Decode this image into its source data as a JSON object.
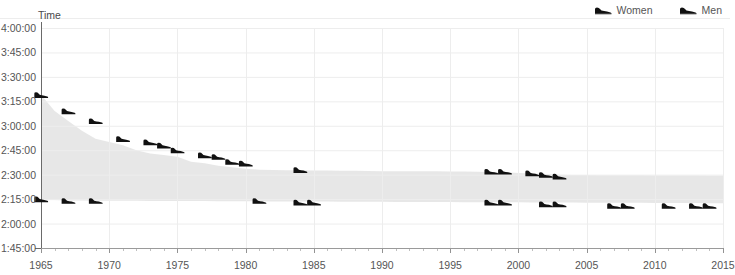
{
  "header": {
    "clipped_title": "",
    "y_axis_title": "Time"
  },
  "legend": {
    "position": "top-right",
    "items": [
      {
        "label": "Women",
        "icon": "shoe-icon",
        "color": "#111111"
      },
      {
        "label": "Men",
        "icon": "shoe-icon",
        "color": "#111111"
      }
    ]
  },
  "colors": {
    "marker": "#111111",
    "area_fill": "#e3e3e3",
    "grid": "#ededed",
    "axis": "#808080",
    "text": "#555555"
  },
  "chart_data": {
    "type": "scatter",
    "title": "",
    "subtitle": "",
    "xlabel": "",
    "ylabel": "Time",
    "grid": true,
    "legend_position": "top-right",
    "xlim": [
      1965,
      2015
    ],
    "ylim_seconds": [
      6300,
      14400
    ],
    "ylim": [
      "1:45:00",
      "4:00:00"
    ],
    "x_ticks": [
      1965,
      1970,
      1975,
      1980,
      1985,
      1990,
      1995,
      2000,
      2005,
      2010,
      2015
    ],
    "x_minor_tick_step": 1,
    "y_ticks": [
      "1:45:00",
      "2:00:00",
      "2:15:00",
      "2:30:00",
      "2:45:00",
      "3:00:00",
      "3:15:00",
      "3:30:00",
      "3:45:00",
      "4:00:00"
    ],
    "y_ticks_seconds": [
      6300,
      7200,
      8100,
      9000,
      9900,
      10800,
      11700,
      12600,
      13500,
      14400
    ],
    "series": [
      {
        "name": "Women",
        "marker": "shoe-icon",
        "points": [
          {
            "x": 1965,
            "y": "3:19:00",
            "seconds": 11940
          },
          {
            "x": 1967,
            "y": "3:09:00",
            "seconds": 11340
          },
          {
            "x": 1969,
            "y": "3:03:00",
            "seconds": 10980
          },
          {
            "x": 1971,
            "y": "2:52:00",
            "seconds": 10320
          },
          {
            "x": 1973,
            "y": "2:50:00",
            "seconds": 10200
          },
          {
            "x": 1974,
            "y": "2:48:00",
            "seconds": 10080
          },
          {
            "x": 1975,
            "y": "2:45:00",
            "seconds": 9900
          },
          {
            "x": 1977,
            "y": "2:42:00",
            "seconds": 9720
          },
          {
            "x": 1978,
            "y": "2:41:00",
            "seconds": 9660
          },
          {
            "x": 1979,
            "y": "2:38:00",
            "seconds": 9480
          },
          {
            "x": 1980,
            "y": "2:37:00",
            "seconds": 9420
          },
          {
            "x": 1984,
            "y": "2:33:00",
            "seconds": 9180
          },
          {
            "x": 1998,
            "y": "2:32:00",
            "seconds": 9120
          },
          {
            "x": 1999,
            "y": "2:32:00",
            "seconds": 9120
          },
          {
            "x": 2001,
            "y": "2:31:00",
            "seconds": 9060
          },
          {
            "x": 2002,
            "y": "2:30:00",
            "seconds": 9000
          },
          {
            "x": 2003,
            "y": "2:29:00",
            "seconds": 8940
          }
        ]
      },
      {
        "name": "Men",
        "marker": "shoe-icon",
        "points": [
          {
            "x": 1965,
            "y": "2:15:00",
            "seconds": 8100
          },
          {
            "x": 1967,
            "y": "2:14:00",
            "seconds": 8040
          },
          {
            "x": 1969,
            "y": "2:14:00",
            "seconds": 8040
          },
          {
            "x": 1981,
            "y": "2:14:00",
            "seconds": 8040
          },
          {
            "x": 1984,
            "y": "2:13:00",
            "seconds": 7980
          },
          {
            "x": 1985,
            "y": "2:13:00",
            "seconds": 7980
          },
          {
            "x": 1998,
            "y": "2:13:00",
            "seconds": 7980
          },
          {
            "x": 1999,
            "y": "2:13:00",
            "seconds": 7980
          },
          {
            "x": 2002,
            "y": "2:12:00",
            "seconds": 7920
          },
          {
            "x": 2003,
            "y": "2:12:00",
            "seconds": 7920
          },
          {
            "x": 2007,
            "y": "2:11:00",
            "seconds": 7860
          },
          {
            "x": 2008,
            "y": "2:11:00",
            "seconds": 7860
          },
          {
            "x": 2011,
            "y": "2:11:00",
            "seconds": 7860
          },
          {
            "x": 2013,
            "y": "2:11:00",
            "seconds": 7860
          },
          {
            "x": 2014,
            "y": "2:11:00",
            "seconds": 7860
          }
        ]
      }
    ],
    "area_band": {
      "description": "shaded region between Women and Men trend envelopes",
      "upper_seconds": [
        11940,
        11340,
        10980,
        10620,
        10320,
        10200,
        10080,
        9900,
        9780,
        9720,
        9660,
        9480,
        9420,
        9330,
        9270,
        9220,
        9180,
        9170,
        9165,
        9160,
        9155,
        9150,
        9145,
        9140,
        9135,
        9130,
        9128,
        9126,
        9124,
        9122,
        9120,
        9118,
        9110,
        9100,
        9080,
        9060,
        9040,
        9020,
        9000,
        8990,
        8985,
        8980,
        8978,
        8976,
        8974,
        8972,
        8970,
        8968,
        8966,
        8964,
        8962
      ],
      "lower_seconds": [
        8100,
        8070,
        8050,
        8045,
        8042,
        8040,
        8038,
        8036,
        8034,
        8032,
        8030,
        8028,
        8026,
        8024,
        8022,
        8020,
        8018,
        8016,
        8014,
        8012,
        8010,
        8008,
        8006,
        8004,
        8002,
        8000,
        7998,
        7996,
        7994,
        7992,
        7990,
        7988,
        7986,
        7984,
        7982,
        7980,
        7978,
        7976,
        7974,
        7972,
        7970,
        7968,
        7966,
        7964,
        7962,
        7960,
        7958,
        7956,
        7954,
        7952,
        7950
      ]
    }
  }
}
